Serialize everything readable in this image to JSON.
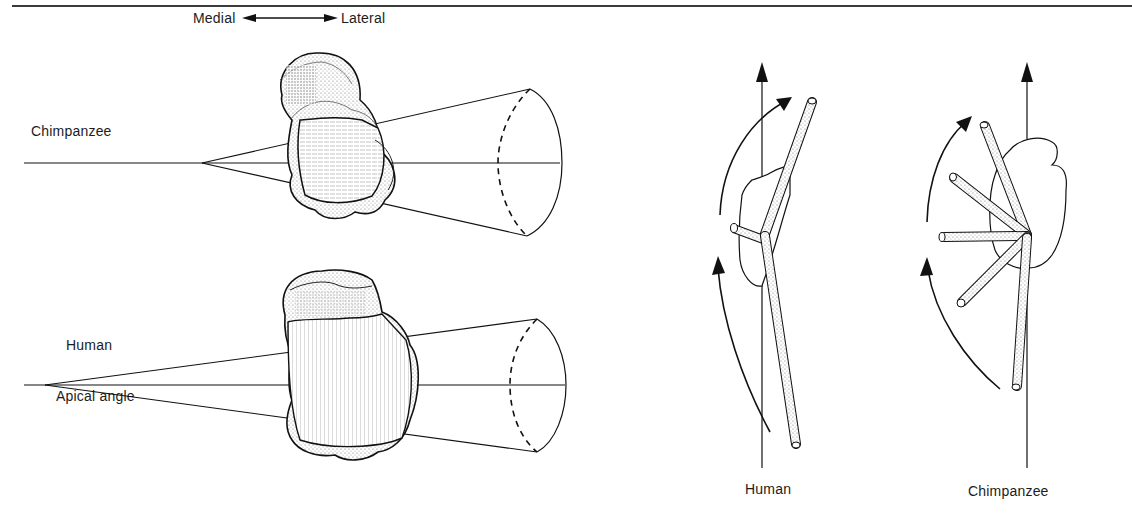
{
  "figure": {
    "left_panel": {
      "title": "Talar trochlea apical angle comparison",
      "direction_indicator": {
        "left_label": "Medial",
        "right_label": "Lateral"
      },
      "rows": [
        {
          "label": "Chimpanzee"
        },
        {
          "label": "Human",
          "sub_label": "Apical angle"
        }
      ]
    },
    "right_panel": {
      "title": "Foot rotation relative to leg axis",
      "subfigures": [
        {
          "label": "Human"
        },
        {
          "label": "Chimpanzee"
        }
      ]
    },
    "colors": {
      "ink": "#1a1a1a",
      "stipple": "#bdbdbd",
      "background": "#ffffff"
    }
  }
}
